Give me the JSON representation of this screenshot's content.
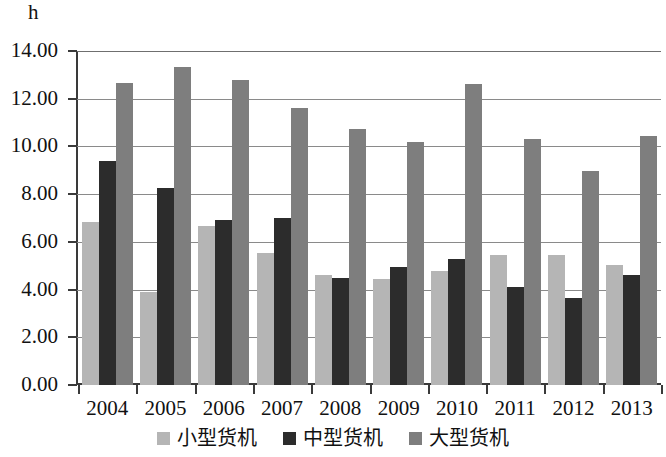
{
  "chart_data": {
    "type": "bar",
    "title": "",
    "subtitle": "",
    "unit_label": "h",
    "xlabel": "",
    "ylabel": "h",
    "ylim": [
      0,
      14
    ],
    "ytick_step": 2,
    "grid": true,
    "legend_position": "bottom",
    "categories": [
      "2004",
      "2005",
      "2006",
      "2007",
      "2008",
      "2009",
      "2010",
      "2011",
      "2012",
      "2013"
    ],
    "ytick_labels": [
      "14.00",
      "12.00",
      "10.00",
      "8.00",
      "6.00",
      "4.00",
      "2.00",
      "0.00"
    ],
    "ytick_values": [
      14,
      12,
      10,
      8,
      6,
      4,
      2,
      0
    ],
    "series": [
      {
        "name": "小型货机",
        "color": "#b5b5b5",
        "values": [
          6.85,
          3.9,
          6.65,
          5.55,
          4.6,
          4.45,
          4.8,
          5.45,
          5.45,
          5.05
        ]
      },
      {
        "name": "中型货机",
        "color": "#2c2c2c",
        "values": [
          9.4,
          8.25,
          6.9,
          7.0,
          4.5,
          4.95,
          5.3,
          4.1,
          3.65,
          4.6
        ]
      },
      {
        "name": "大型货机",
        "color": "#7e7e7e",
        "values": [
          12.65,
          13.35,
          12.8,
          11.6,
          10.75,
          10.2,
          12.6,
          10.3,
          8.95,
          10.45
        ]
      }
    ]
  },
  "colors": {
    "small": "#b5b5b5",
    "medium": "#2c2c2c",
    "large": "#7e7e7e",
    "axis": "#3a3a3a",
    "grid": "#8a8a8a",
    "background": "#ffffff"
  }
}
